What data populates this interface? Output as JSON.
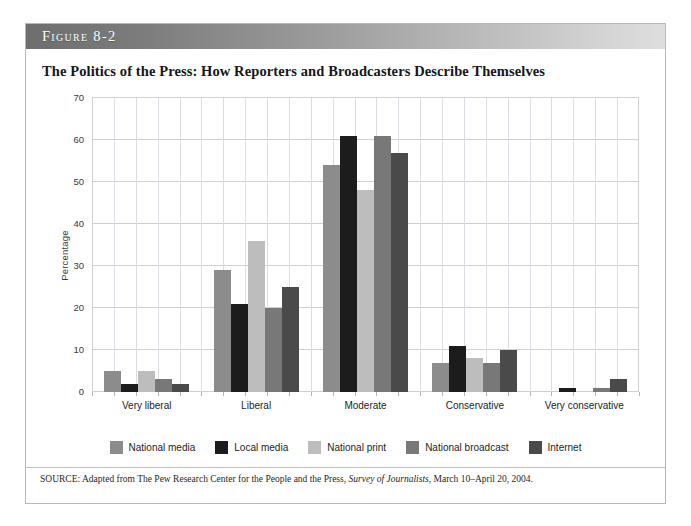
{
  "figure": {
    "label": "Figure 8-2",
    "title": "The Politics of the Press: How Reporters and Broadcasters Describe Themselves",
    "source_prefix": "SOURCE:",
    "source_text_1": " Adapted from The Pew Research Center for the People and the Press, ",
    "source_italic": "Survey of Journalists",
    "source_text_2": ", March 10–April 20, 2004."
  },
  "chart_data": {
    "type": "bar",
    "title": "The Politics of the Press: How Reporters and Broadcasters Describe Themselves",
    "xlabel": "",
    "ylabel": "Percentage",
    "ylim": [
      0,
      70
    ],
    "yticks": [
      0,
      10,
      20,
      30,
      40,
      50,
      60,
      70
    ],
    "grid": true,
    "legend_position": "bottom",
    "categories": [
      "Very liberal",
      "Liberal",
      "Moderate",
      "Conservative",
      "Very conservative"
    ],
    "series": [
      {
        "name": "National media",
        "color": "#8c8c8c",
        "values": [
          5,
          29,
          54,
          7,
          0
        ]
      },
      {
        "name": "Local media",
        "color": "#1c1c1c",
        "values": [
          2,
          21,
          61,
          11,
          1
        ]
      },
      {
        "name": "National print",
        "color": "#bdbdbd",
        "values": [
          5,
          36,
          48,
          8,
          0
        ]
      },
      {
        "name": "National broadcast",
        "color": "#787878",
        "values": [
          3,
          20,
          61,
          7,
          1
        ]
      },
      {
        "name": "Internet",
        "color": "#4a4a4a",
        "values": [
          2,
          25,
          57,
          10,
          3
        ]
      }
    ]
  }
}
